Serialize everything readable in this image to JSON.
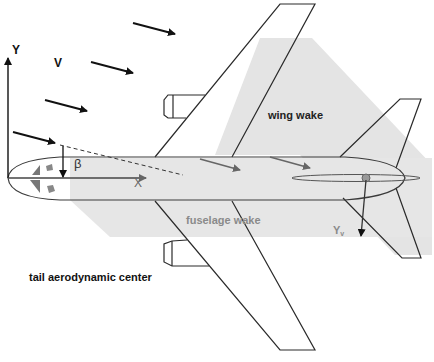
{
  "diagram": {
    "labels": {
      "y_axis": "Y",
      "velocity": "V",
      "x_axis": "X",
      "beta": "β",
      "wing_wake": "wing wake",
      "fuselage_wake": "fuselage wake",
      "tail_force": "Y",
      "tail_force_sub": "v",
      "tail_center": "tail aerodynamic center"
    },
    "colors": {
      "wake_fill": "#e2e2e2",
      "outline": "#2a2a2a",
      "grey_text": "#8a8a8a",
      "black_text": "#111111"
    }
  }
}
